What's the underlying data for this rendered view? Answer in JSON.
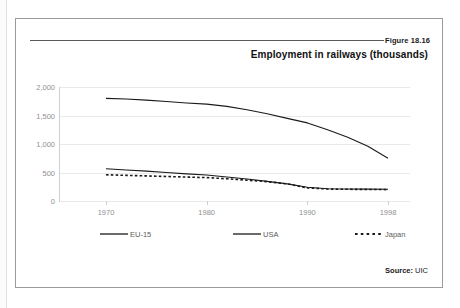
{
  "figure": {
    "number": "Figure 18.16",
    "title": "Employment in railways (thousands)",
    "source_label": "Source:",
    "source_value": "UIC"
  },
  "chart_data": {
    "type": "line",
    "title": "Employment in railways (thousands)",
    "xlabel": "",
    "ylabel": "",
    "xlim": [
      1970,
      1998
    ],
    "ylim": [
      0,
      2000
    ],
    "grid": true,
    "legend_position": "bottom",
    "x_ticks": [
      "1970",
      "1980",
      "1990",
      "1998"
    ],
    "y_ticks": [
      "0",
      "500",
      "1,000",
      "1,500",
      "2,000"
    ],
    "x": [
      1970,
      1972,
      1974,
      1976,
      1978,
      1980,
      1982,
      1984,
      1986,
      1988,
      1990,
      1992,
      1994,
      1996,
      1998
    ],
    "series": [
      {
        "name": "EU-15",
        "style": "solid",
        "color": "#1a1a1a",
        "values": [
          1800,
          1790,
          1770,
          1745,
          1720,
          1700,
          1660,
          1600,
          1530,
          1450,
          1370,
          1250,
          1120,
          960,
          750
        ]
      },
      {
        "name": "USA",
        "style": "solid",
        "color": "#1a1a1a",
        "values": [
          565,
          545,
          525,
          500,
          475,
          455,
          420,
          385,
          345,
          300,
          240,
          215,
          210,
          208,
          205
        ]
      },
      {
        "name": "Japan",
        "style": "dotted",
        "color": "#1a1a1a",
        "values": [
          460,
          450,
          440,
          430,
          420,
          410,
          390,
          365,
          340,
          300,
          230,
          210,
          205,
          203,
          200
        ]
      }
    ]
  },
  "legend": {
    "items": [
      {
        "label": "EU-15",
        "style": "solid"
      },
      {
        "label": "USA",
        "style": "solid"
      },
      {
        "label": "Japan",
        "style": "dotted"
      }
    ]
  }
}
